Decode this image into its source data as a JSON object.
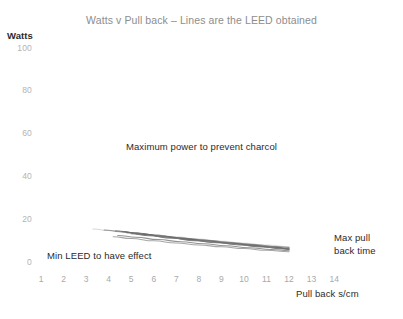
{
  "chart_data": {
    "type": "line",
    "title": "Watts v Pull back – Lines are the LEED obtained",
    "xlabel": "Pull back s/cm",
    "ylabel": "Watts",
    "xlim": [
      0,
      14.6
    ],
    "ylim": [
      0,
      100
    ],
    "grid": false,
    "legend": "none",
    "xticks": [
      "1",
      "2",
      "3",
      "4",
      "5",
      "6",
      "7",
      "8",
      "9",
      "10",
      "11",
      "12",
      "13",
      "14"
    ],
    "xtick_values": [
      1,
      2,
      3,
      4,
      5,
      6,
      7,
      8,
      9,
      10,
      11,
      12,
      13,
      14
    ],
    "yticks": [
      "0",
      "20",
      "40",
      "60",
      "80",
      "100"
    ],
    "ytick_values": [
      0,
      20,
      40,
      60,
      80,
      100
    ],
    "annotations": [
      {
        "name": "max-power",
        "text": "Maximum power to prevent charcol"
      },
      {
        "name": "min-leed",
        "text": "Min LEED to have effect"
      },
      {
        "name": "max-pull-line1",
        "text": "Max pull"
      },
      {
        "name": "max-pull-line2",
        "text": "back time"
      }
    ],
    "series": [
      {
        "name": "LEED 1",
        "color": "#9a9a9a",
        "x": [
          3.3,
          4.0,
          5.0,
          6.0,
          7.0,
          8.0,
          9.0,
          10.0,
          11.0,
          12.0
        ],
        "y": [
          15.6,
          14.9,
          13.9,
          12.9,
          11.9,
          10.9,
          9.9,
          9.0,
          8.1,
          7.4
        ]
      },
      {
        "name": "LEED 2",
        "color": "#8e8e8e",
        "x": [
          3.8,
          4.5,
          5.5,
          6.5,
          7.5,
          8.5,
          9.5,
          10.5,
          11.5,
          12.0
        ],
        "y": [
          15.2,
          14.4,
          13.3,
          12.2,
          11.2,
          10.2,
          9.2,
          8.3,
          7.4,
          7.0
        ]
      },
      {
        "name": "LEED 3",
        "color": "#7e7e7e",
        "x": [
          4.3,
          5.0,
          6.0,
          7.0,
          8.0,
          9.0,
          10.0,
          11.0,
          12.0
        ],
        "y": [
          14.8,
          14.0,
          12.8,
          11.7,
          10.6,
          9.6,
          8.6,
          7.6,
          6.7
        ]
      },
      {
        "name": "LEED 4",
        "color": "#6f6f6f",
        "x": [
          4.6,
          5.3,
          6.3,
          7.3,
          8.3,
          9.3,
          10.3,
          11.3,
          12.0
        ],
        "y": [
          14.4,
          13.6,
          12.4,
          11.2,
          10.1,
          9.1,
          8.1,
          7.1,
          6.4
        ]
      },
      {
        "name": "LEED 5",
        "color": "#666666",
        "x": [
          4.8,
          5.6,
          6.6,
          7.6,
          8.6,
          9.6,
          10.6,
          11.6,
          12.0
        ],
        "y": [
          13.9,
          13.0,
          11.8,
          10.7,
          9.6,
          8.6,
          7.6,
          6.7,
          6.2
        ]
      },
      {
        "name": "LEED 6",
        "color": "#767676",
        "x": [
          5.0,
          5.8,
          6.8,
          7.8,
          8.8,
          9.8,
          10.8,
          11.8,
          12.0
        ],
        "y": [
          13.4,
          12.5,
          11.3,
          10.2,
          9.2,
          8.2,
          7.2,
          6.3,
          6.0
        ]
      },
      {
        "name": "LEED 7",
        "color": "#8a8a8a",
        "x": [
          4.4,
          5.2,
          6.2,
          7.2,
          8.2,
          9.2,
          10.2,
          11.2,
          12.0
        ],
        "y": [
          12.6,
          11.8,
          10.7,
          9.7,
          8.7,
          7.8,
          6.9,
          6.1,
          5.5
        ]
      },
      {
        "name": "LEED 8",
        "color": "#9e9e9e",
        "x": [
          4.2,
          5.0,
          6.0,
          7.0,
          8.0,
          9.0,
          10.0,
          11.0,
          12.0
        ],
        "y": [
          12.0,
          11.2,
          10.1,
          9.1,
          8.2,
          7.3,
          6.5,
          5.7,
          5.0
        ]
      }
    ]
  }
}
